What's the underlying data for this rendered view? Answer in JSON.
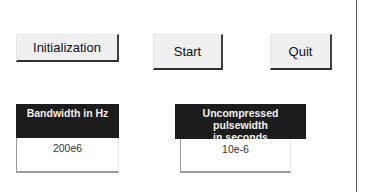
{
  "buttons": {
    "initialization": "Initialization",
    "start": "Start",
    "quit": "Quit"
  },
  "fields": {
    "bandwidth": {
      "label": "Bandwidth in Hz",
      "value": "200e6"
    },
    "pulsewidth": {
      "label_line1": "Uncompressed pulsewidth",
      "label_line2": "in seconds",
      "value": "10e-6"
    }
  }
}
